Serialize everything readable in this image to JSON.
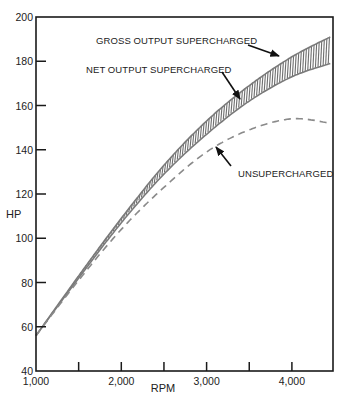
{
  "chart_data": {
    "type": "line",
    "title": "",
    "xlabel": "RPM",
    "ylabel": "HP",
    "xlim": [
      1000,
      4470
    ],
    "ylim": [
      40,
      200
    ],
    "grid": false,
    "x_ticks": [
      1000,
      1500,
      2000,
      2500,
      3000,
      3500,
      4000
    ],
    "x_tick_labels": [
      "1,000",
      "",
      "2,000",
      "",
      "3,000",
      "",
      "4,000"
    ],
    "y_ticks": [
      40,
      60,
      80,
      100,
      120,
      140,
      160,
      180,
      200
    ],
    "y_tick_labels": [
      "40",
      "60",
      "80",
      "100",
      "120",
      "140",
      "160",
      "180",
      "200"
    ],
    "series": [
      {
        "name": "GROSS OUTPUT SUPERCHARGED",
        "style": "solid-upper-boundary-of-hatched-band",
        "x": [
          1000,
          1500,
          2000,
          2500,
          3000,
          3500,
          4000,
          4450
        ],
        "y": [
          56,
          83,
          109,
          133,
          153,
          169,
          182,
          191
        ]
      },
      {
        "name": "NET OUTPUT SUPERCHARGED",
        "style": "solid-lower-boundary-of-hatched-band",
        "x": [
          1000,
          1500,
          2000,
          2500,
          3000,
          3500,
          4000,
          4450
        ],
        "y": [
          56,
          82,
          107,
          129,
          147,
          162,
          173,
          179
        ]
      },
      {
        "name": "UNSUPERCHARGED",
        "style": "dashed",
        "x": [
          1000,
          1500,
          2000,
          2500,
          3000,
          3500,
          4000,
          4450
        ],
        "y": [
          56,
          81,
          104,
          123,
          139,
          149,
          154,
          152
        ]
      }
    ],
    "annotations": [
      {
        "text": "GROSS OUTPUT SUPERCHARGED",
        "points_to": "GROSS OUTPUT SUPERCHARGED",
        "arrow_target": [
          3900,
          180
        ]
      },
      {
        "text": "NET OUTPUT SUPERCHARGED",
        "points_to": "NET OUTPUT SUPERCHARGED",
        "arrow_target": [
          3420,
          160
        ]
      },
      {
        "text": "UNSUPERCHARGED",
        "points_to": "UNSUPERCHARGED",
        "arrow_target": [
          3120,
          142
        ]
      }
    ],
    "fill_between": {
      "upper": "GROSS OUTPUT SUPERCHARGED",
      "lower": "NET OUTPUT SUPERCHARGED",
      "pattern": "vertical-hatch"
    },
    "legend": "none (inline annotations with arrows)"
  },
  "labels": {
    "gross": "GROSS OUTPUT SUPERCHARGED",
    "net": "NET OUTPUT SUPERCHARGED",
    "unsup": "UNSUPERCHARGED",
    "xlabel": "RPM",
    "ylabel": "HP"
  },
  "colors": {
    "axis": "#1a1a1a",
    "curve": "#7a7a7a",
    "hatch": "#6e6e6e",
    "text": "#222222",
    "arrow": "#111111"
  }
}
